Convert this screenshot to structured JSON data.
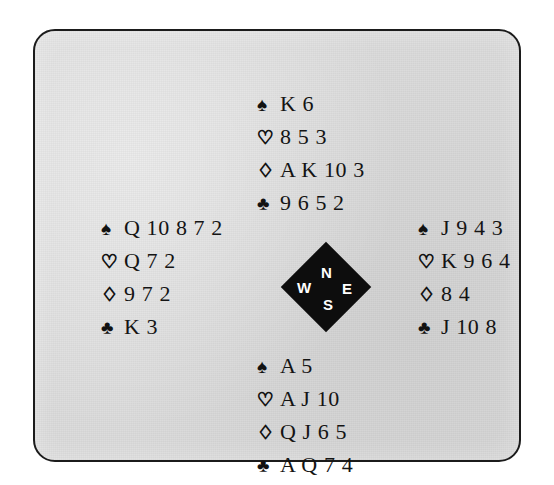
{
  "diagram": {
    "panel_background": "#dcdcdc",
    "border_color": "#1b1b1b",
    "page_background": "#ffffff"
  },
  "suits": {
    "spade": {
      "glyph": "♠",
      "name": "spade-symbol",
      "color": "#121212",
      "filled": true
    },
    "heart": {
      "glyph": "♡",
      "name": "heart-symbol",
      "color": "#ffffff",
      "filled": false
    },
    "diamond": {
      "glyph": "♢",
      "name": "diamond-symbol",
      "color": "#ffffff",
      "filled": false
    },
    "club": {
      "glyph": "♣",
      "name": "club-symbol",
      "color": "#121212",
      "filled": true
    }
  },
  "compass": {
    "shape": "diamond",
    "fill": "#0d0d0d",
    "text_color": "#ffffff",
    "north": "N",
    "west": "W",
    "east": "E",
    "south": "S"
  },
  "hands": {
    "north": {
      "position_label": "North",
      "spades": "K 6",
      "hearts": "8 5 3",
      "diamonds": "A K 10 3",
      "clubs": "9 6 5 2"
    },
    "west": {
      "position_label": "West",
      "spades": "Q 10 8 7 2",
      "hearts": "Q 7 2",
      "diamonds": "9 7 2",
      "clubs": "K 3"
    },
    "east": {
      "position_label": "East",
      "spades": "J 9 4 3",
      "hearts": "K 9 6 4",
      "diamonds": "8 4",
      "clubs": "J 10 8"
    },
    "south": {
      "position_label": "South",
      "spades": "A 5",
      "hearts": "A J 10",
      "diamonds": "Q J 6 5",
      "clubs": "A Q 7 4"
    }
  }
}
